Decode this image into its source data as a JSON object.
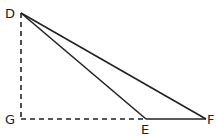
{
  "diagram": {
    "type": "geometry",
    "points": {
      "D": {
        "label": "D",
        "x": 21,
        "y": 13
      },
      "G": {
        "label": "G",
        "x": 21,
        "y": 119
      },
      "E": {
        "label": "E",
        "x": 146,
        "y": 119
      },
      "F": {
        "label": "F",
        "x": 206,
        "y": 119
      }
    },
    "segments": [
      {
        "from": "D",
        "to": "E",
        "style": "solid"
      },
      {
        "from": "D",
        "to": "F",
        "style": "solid"
      },
      {
        "from": "E",
        "to": "F",
        "style": "solid"
      },
      {
        "from": "D",
        "to": "G",
        "style": "dashed"
      },
      {
        "from": "G",
        "to": "E",
        "style": "dashed"
      }
    ],
    "colors": {
      "line": "#222222",
      "background": "#ffffff"
    }
  }
}
